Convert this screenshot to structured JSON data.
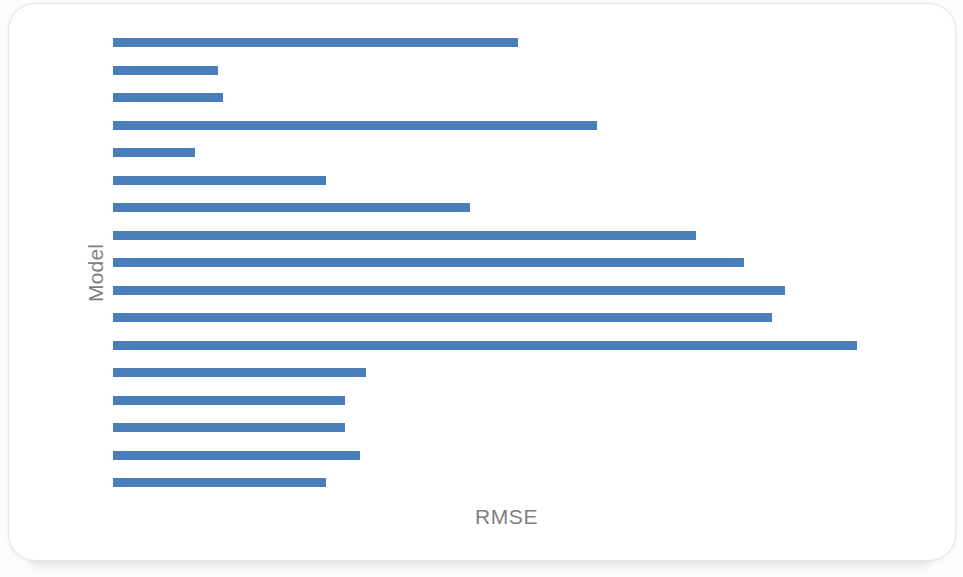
{
  "chart_data": {
    "type": "bar",
    "orientation": "horizontal",
    "title": "",
    "subtitle": "",
    "xlabel": "RMSE",
    "ylabel": "Model",
    "grid": false,
    "legend": null,
    "legend_position": "none",
    "axis_tick_labels_visible": false,
    "xlim": [
      0,
      0.82
    ],
    "categories": [
      "Model 1",
      "Model 2",
      "Model 3",
      "Model 4",
      "Model 5",
      "Model 6",
      "Model 7",
      "Model 8",
      "Model 9",
      "Model 10",
      "Model 11",
      "Model 12",
      "Model 13",
      "Model 14",
      "Model 15",
      "Model 16",
      "Model 17"
    ],
    "values": [
      0.545,
      0.141,
      0.148,
      0.651,
      0.11,
      0.286,
      0.48,
      0.784,
      0.848,
      0.903,
      0.886,
      1.0,
      0.34,
      0.312,
      0.312,
      0.332,
      0.286
    ],
    "bar_pixel_lengths": [
      405,
      105,
      110,
      484,
      82,
      213,
      357,
      583,
      631,
      672,
      659,
      744,
      253,
      232,
      232,
      247,
      213
    ],
    "bar_color": "#4A7EBB",
    "bar_count": 17,
    "bar_thickness_px": 9,
    "bar_pitch_px": 27.5,
    "plot_origin_x_px": 113,
    "plot_first_bar_top_px": 38
  },
  "card": {
    "background": "#ffffff",
    "border_radius_px": 26
  },
  "labels": {
    "y_axis": "Model",
    "x_axis": "RMSE",
    "axis_text_color": "#7f7f83"
  }
}
